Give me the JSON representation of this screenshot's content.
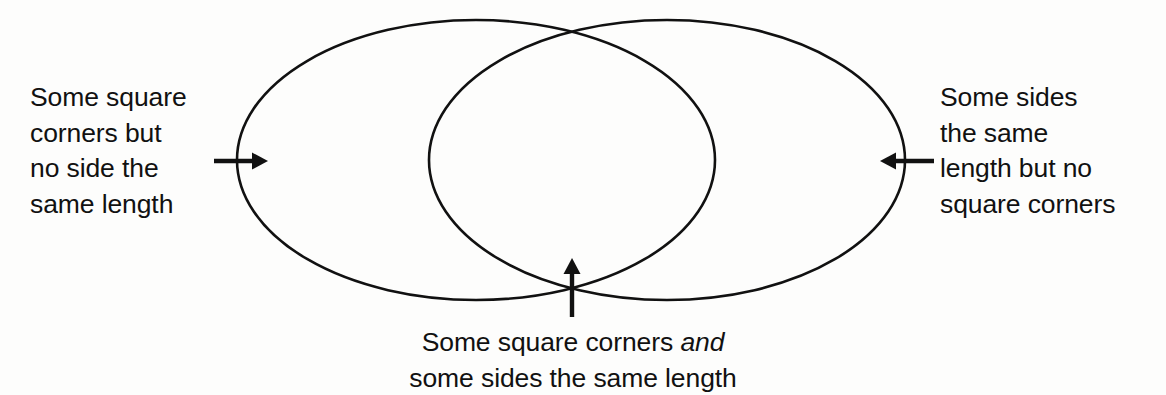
{
  "diagram": {
    "type": "venn",
    "title": "",
    "background_color": "#fdfdfc",
    "stroke_color": "#111111",
    "text_color": "#111111",
    "sets": [
      {
        "name": "left-set",
        "label": "Some square\ncorners but\nno side the\nsame length",
        "center_x": 476,
        "center_y": 160,
        "radius_x": 239,
        "radius_y": 140
      },
      {
        "name": "right-set",
        "label": "Some sides\nthe same\nlength but no\nsquare corners",
        "center_x": 667,
        "center_y": 160,
        "radius_x": 238,
        "radius_y": 140
      }
    ],
    "intersection": {
      "name": "intersection",
      "label_line1_prefix": "Some square corners ",
      "label_line1_emphasis": "and",
      "label_line2": "some sides the same length"
    },
    "annotations": [
      {
        "name": "left-pointer",
        "direction": "right",
        "from_x": 214,
        "to_x": 266,
        "y": 161
      },
      {
        "name": "right-pointer",
        "direction": "left",
        "from_x": 934,
        "to_x": 882,
        "y": 161
      },
      {
        "name": "bottom-pointer",
        "direction": "up",
        "x": 572,
        "from_y": 316,
        "to_y": 260
      }
    ]
  }
}
